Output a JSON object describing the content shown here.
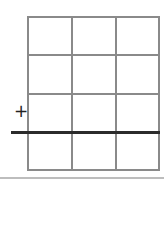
{
  "worksheet": {
    "operator_symbol": "+",
    "grid": {
      "rows": 4,
      "columns": 3,
      "cells": [
        [
          "",
          "",
          ""
        ],
        [
          "",
          "",
          ""
        ],
        [
          "",
          "",
          ""
        ],
        [
          "",
          "",
          ""
        ]
      ],
      "line_color": "#8a8a8a"
    },
    "sum_line_color": "#2b2b2b",
    "bottom_rule_color": "#bdbdbd"
  }
}
